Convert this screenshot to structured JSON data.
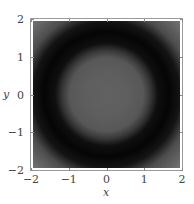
{
  "chart_data": {
    "type": "heatmap",
    "title": "",
    "xlabel": "x",
    "ylabel": "y",
    "xlim": [
      -2,
      2
    ],
    "ylim": [
      -2,
      2
    ],
    "x_ticks": [
      "-2",
      "-1",
      "0",
      "1",
      "2"
    ],
    "y_ticks": [
      "-2",
      "-1",
      "0",
      "1",
      "2"
    ],
    "x_tick_labels": [
      "−2",
      "−1",
      "0",
      "1",
      "2"
    ],
    "y_tick_labels": [
      "2",
      "1",
      "0",
      "−1",
      "−2"
    ],
    "grid": false,
    "legend": null,
    "colormap": "grayscale",
    "radial_profile": [
      {
        "r": 0.0,
        "value": 0.38
      },
      {
        "r": 0.6,
        "value": 0.37
      },
      {
        "r": 1.0,
        "value": 0.34
      },
      {
        "r": 1.2,
        "value": 0.22
      },
      {
        "r": 1.4,
        "value": 0.06
      },
      {
        "r": 1.7,
        "value": 0.02
      },
      {
        "r": 2.0,
        "value": 0.08
      },
      {
        "r": 2.3,
        "value": 0.3
      },
      {
        "r": 2.83,
        "value": 0.45
      }
    ],
    "colors": {
      "center": "#616161",
      "ring": "#050505",
      "corner": "#707070"
    }
  },
  "axes": {
    "x_label": "x",
    "y_label": "y"
  }
}
